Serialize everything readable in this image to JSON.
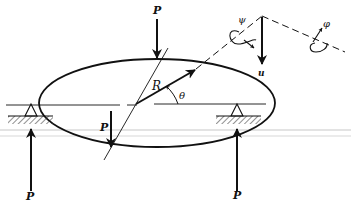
{
  "figure": {
    "labels": {
      "load_top": "P",
      "load_inner": "P",
      "reaction_left": "P",
      "reaction_right": "P",
      "radius": "R",
      "angle": "θ",
      "displacement": "u",
      "rotation_psi": "ψ",
      "rotation_phi": "φ"
    },
    "colors": {
      "ink": "#111111",
      "hatch": "#333333",
      "background": "#ffffff",
      "scan_line": "#c8c8c8"
    }
  }
}
